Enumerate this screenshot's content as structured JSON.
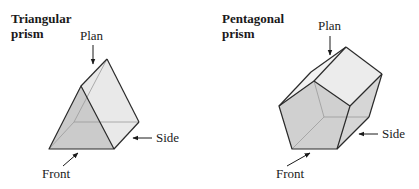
{
  "figures": [
    {
      "name": "triangular-prism",
      "title_line1": "Triangular",
      "title_line2": "prism",
      "labels": {
        "plan": "Plan",
        "side": "Side",
        "front": "Front"
      }
    },
    {
      "name": "pentagonal-prism",
      "title_line1": "Pentagonal",
      "title_line2": "prism",
      "labels": {
        "plan": "Plan",
        "side": "Side",
        "front": "Front"
      }
    }
  ],
  "colors": {
    "edge": "#2a2a2a",
    "hidden_edge": "#8a8a8a",
    "face_front": "#cfcfcf",
    "face_top": "#ececec",
    "face_side": "#dadada",
    "arrow": "#1a1a1a"
  }
}
